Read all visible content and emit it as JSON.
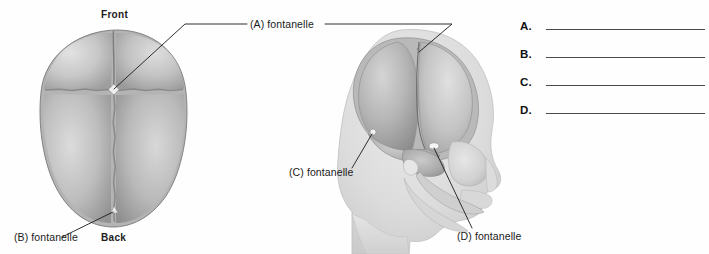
{
  "figure": {
    "type": "anatomical-diagram",
    "background_color": "#fefefe",
    "ink_color": "#1a1a1a"
  },
  "superior_view": {
    "orientation_labels": {
      "front": "Front",
      "back": "Back"
    },
    "callouts": [
      {
        "id": "A",
        "text": "(A) fontanelle"
      },
      {
        "id": "B",
        "text": "(B) fontanelle"
      }
    ]
  },
  "lateral_view": {
    "callouts": [
      {
        "id": "C",
        "text": "(C) fontanelle"
      },
      {
        "id": "D",
        "text": "(D) fontanelle"
      }
    ]
  },
  "answer_key": {
    "rows": [
      {
        "letter": "A.",
        "value": ""
      },
      {
        "letter": "B.",
        "value": ""
      },
      {
        "letter": "C.",
        "value": ""
      },
      {
        "letter": "D.",
        "value": ""
      }
    ]
  }
}
